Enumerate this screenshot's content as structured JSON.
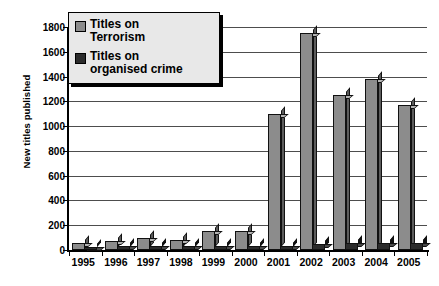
{
  "chart_data": {
    "type": "bar",
    "title": "",
    "xlabel": "",
    "ylabel": "New titles published",
    "ylim": [
      0,
      1800
    ],
    "ytick_step": 200,
    "yticks": [
      0,
      200,
      400,
      600,
      800,
      1000,
      1200,
      1400,
      1600,
      1800
    ],
    "grid": true,
    "legend_position": "top-left",
    "categories": [
      "1995",
      "1996",
      "1997",
      "1998",
      "1999",
      "2000",
      "2001",
      "2002",
      "2003",
      "2004",
      "2005"
    ],
    "series": [
      {
        "name": "Titles on Terrorism",
        "color": "#8c8c8c",
        "values": [
          60,
          75,
          95,
          80,
          150,
          150,
          1100,
          1750,
          1250,
          1380,
          1170
        ]
      },
      {
        "name": "Titles on organised crime",
        "color": "#2b2b2b",
        "values": [
          25,
          30,
          30,
          30,
          35,
          30,
          35,
          45,
          55,
          55,
          60
        ]
      }
    ]
  },
  "legend": {
    "items": [
      {
        "label_line1": "Titles on",
        "label_line2": "Terrorism",
        "swatch": "terrorism-swatch"
      },
      {
        "label_line1": "Titles on",
        "label_line2": "organised crime",
        "swatch": "organised-crime-swatch"
      }
    ]
  }
}
